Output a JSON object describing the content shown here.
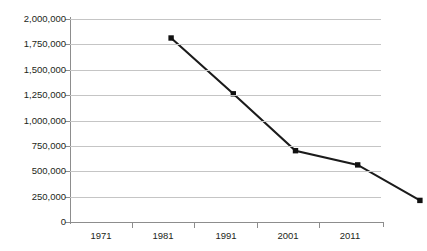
{
  "chart_data": {
    "type": "line",
    "title": "",
    "xlabel": "",
    "ylabel": "",
    "categories": [
      "1971",
      "1981",
      "1991",
      "2001",
      "2011"
    ],
    "values": [
      2000000,
      1450000,
      890000,
      750000,
      400000
    ],
    "series": [
      {
        "name": "series-1",
        "values": [
          2000000,
          1450000,
          890000,
          750000,
          400000
        ]
      }
    ],
    "ylim": [
      0,
      2000000
    ],
    "ytick_values": [
      0,
      250000,
      500000,
      750000,
      1000000,
      1250000,
      1500000,
      1750000,
      2000000
    ],
    "ytick_labels": [
      "0",
      "250,000",
      "500,000",
      "750,000",
      "1,000,000",
      "1,250,000",
      "1,500,000",
      "1,750,000",
      "2,000,000"
    ],
    "xtick_labels": [
      "1971",
      "1981",
      "1991",
      "2001",
      "2011"
    ],
    "grid": "horizontal",
    "legend": "none",
    "marker": "square",
    "colors": {
      "line": "#1b1b1b",
      "marker": "#111111",
      "gridline": "#c5c5c5",
      "axis": "#8d8d8d",
      "text": "#231f20",
      "background": "#ffffff"
    }
  },
  "title_clip": {
    "text": ""
  }
}
